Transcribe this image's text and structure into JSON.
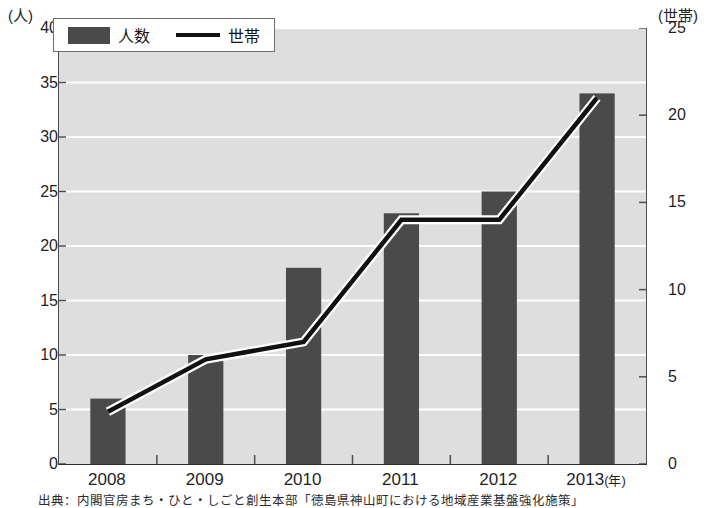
{
  "chart_data": {
    "type": "bar",
    "title": "",
    "xlabel": "(年)",
    "ylabel": "(人)",
    "y2label": "(世帯)",
    "grid": true,
    "legend_position": "top-left",
    "categories": [
      "2008",
      "2009",
      "2010",
      "2011",
      "2012",
      "2013"
    ],
    "ylim": [
      0,
      40
    ],
    "y2lim": [
      0,
      25
    ],
    "yticks": [
      "40",
      "35",
      "30",
      "25",
      "20",
      "15",
      "10",
      "5",
      "0"
    ],
    "y2ticks": [
      "25",
      "20",
      "15",
      "10",
      "5",
      "0"
    ],
    "series": [
      {
        "name": "人数",
        "type": "bar",
        "axis": "left",
        "color": "#4a4a4a",
        "values": [
          6,
          10,
          18,
          23,
          25,
          34
        ]
      },
      {
        "name": "世帯",
        "type": "line",
        "axis": "right",
        "color": "#111111",
        "values": [
          3,
          6,
          7,
          14,
          14,
          21
        ]
      }
    ]
  },
  "axes": {
    "left_unit": "(人)",
    "right_unit": "(世帯)",
    "x_unit": "(年)"
  },
  "legend": {
    "items": [
      {
        "label": "人数"
      },
      {
        "label": "世帯"
      }
    ]
  },
  "footer": {
    "source": "出典：内閣官房まち・ひと・しごと創生本部「徳島県神山町における地域産業基盤強化施策」"
  }
}
